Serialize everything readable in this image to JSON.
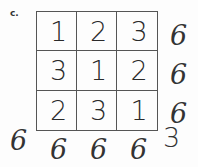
{
  "label": "c.",
  "grid": [
    [
      1,
      2,
      3
    ],
    [
      3,
      1,
      2
    ],
    [
      2,
      3,
      1
    ]
  ],
  "row_sums": [
    6,
    6,
    6
  ],
  "col_sums": [
    6,
    6,
    6
  ],
  "diag_sum_left": 6,
  "diag_sum_right": 3
}
